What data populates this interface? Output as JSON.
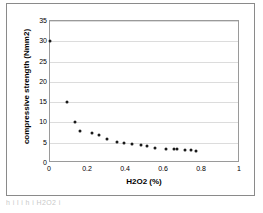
{
  "figure": {
    "caption_fragment": "h i   l   i   h             i  H2O2                        i"
  },
  "chart_data": {
    "type": "scatter",
    "title": "",
    "xlabel": "H2O2 (%)",
    "ylabel": "compressive strength (Nmm2)",
    "xlim": [
      0,
      1
    ],
    "ylim": [
      0,
      35
    ],
    "xticks": [
      "0",
      "0.2",
      "0.4",
      "0.6",
      "0.8",
      "1"
    ],
    "xtick_values": [
      0,
      0.2,
      0.4,
      0.6,
      0.8,
      1
    ],
    "yticks": [
      "0",
      "5",
      "10",
      "15",
      "20",
      "25",
      "30",
      "35"
    ],
    "ytick_values": [
      0,
      5,
      10,
      15,
      20,
      25,
      30,
      35
    ],
    "grid": "horizontal",
    "legend": "none",
    "marker_color": "#1a1a1a",
    "series": [
      {
        "name": "compressive strength",
        "points": [
          {
            "x": 0.0,
            "y": 30.0
          },
          {
            "x": 0.09,
            "y": 15.1
          },
          {
            "x": 0.13,
            "y": 10.1
          },
          {
            "x": 0.16,
            "y": 7.9
          },
          {
            "x": 0.22,
            "y": 7.4
          },
          {
            "x": 0.26,
            "y": 6.9
          },
          {
            "x": 0.3,
            "y": 5.9
          },
          {
            "x": 0.35,
            "y": 5.2
          },
          {
            "x": 0.39,
            "y": 4.9
          },
          {
            "x": 0.43,
            "y": 4.8
          },
          {
            "x": 0.48,
            "y": 4.4
          },
          {
            "x": 0.51,
            "y": 4.1
          },
          {
            "x": 0.55,
            "y": 3.7
          },
          {
            "x": 0.61,
            "y": 3.5
          },
          {
            "x": 0.65,
            "y": 3.4
          },
          {
            "x": 0.67,
            "y": 3.4
          },
          {
            "x": 0.71,
            "y": 3.1
          },
          {
            "x": 0.74,
            "y": 3.1
          },
          {
            "x": 0.77,
            "y": 2.9
          }
        ]
      }
    ]
  }
}
